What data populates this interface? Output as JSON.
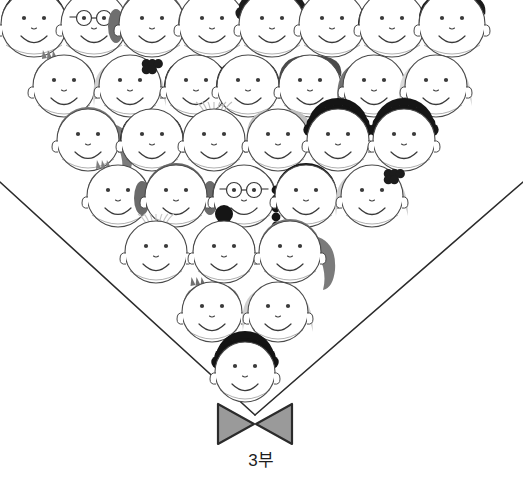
{
  "illustration": {
    "title": "choir-crowd-illustration",
    "background_color": "#ffffff",
    "line_color": "#2b2b2b",
    "face_outline_color": "#4a4a4a",
    "feature_color": "#3a3a3a",
    "collar": {
      "name": "v-neck-collar",
      "left_start": [
        0,
        182
      ],
      "apex": [
        255,
        415
      ],
      "right_start": [
        523,
        182
      ],
      "stroke_width": 1.6,
      "color": "#2b2b2b"
    },
    "bow_tie": {
      "name": "bow-tie",
      "fill_color": "#9a9a9a",
      "stroke_color": "#2b2b2b",
      "center": [
        255,
        424
      ],
      "width": 74,
      "height": 40
    },
    "hair_palette": {
      "black": "#1a1a1a",
      "dark_gray": "#4f4f4f",
      "mid_gray": "#7d7d7d",
      "light_gray": "#aeaeae",
      "pale_gray": "#d2d2d2",
      "blonde": "#c9c9c9"
    },
    "rows": [
      {
        "index": 0,
        "y": 24,
        "faces": [
          {
            "x": 34,
            "r": 33,
            "hair": "spiky-black",
            "hair_color": "#1a1a1a",
            "accessory": "none",
            "clipped_top": true
          },
          {
            "x": 94,
            "r": 33,
            "hair": "short-gray",
            "hair_color": "#8e8e8e",
            "accessory": "glasses",
            "clipped_top": true
          },
          {
            "x": 152,
            "r": 33,
            "hair": "pigtails-gray",
            "hair_color": "#6f6f6f",
            "accessory": "none",
            "clipped_top": true
          },
          {
            "x": 212,
            "r": 33,
            "hair": "bowl-gray",
            "hair_color": "#6b6b6b",
            "accessory": "none",
            "clipped_top": true
          },
          {
            "x": 272,
            "r": 33,
            "hair": "curly-black",
            "hair_color": "#1c1c1c",
            "accessory": "none",
            "clipped_top": true
          },
          {
            "x": 332,
            "r": 33,
            "hair": "wispy-light",
            "hair_color": "#c4c4c4",
            "accessory": "none",
            "clipped_top": true
          },
          {
            "x": 392,
            "r": 33,
            "hair": "bob-black",
            "hair_color": "#141414",
            "accessory": "none",
            "clipped_top": true
          },
          {
            "x": 452,
            "r": 33,
            "hair": "side-part-black",
            "hair_color": "#1a1a1a",
            "accessory": "none",
            "clipped_top": true
          }
        ]
      },
      {
        "index": 1,
        "y": 86,
        "faces": [
          {
            "x": 64,
            "r": 31,
            "hair": "short-gray-tuft",
            "hair_color": "#7a7a7a",
            "accessory": "none"
          },
          {
            "x": 130,
            "r": 31,
            "hair": "blonde-wavy",
            "hair_color": "#cfcfcf",
            "accessory": "hair-bow-black"
          },
          {
            "x": 196,
            "r": 31,
            "hair": "bowl-black",
            "hair_color": "#141414",
            "accessory": "none"
          },
          {
            "x": 248,
            "r": 31,
            "hair": "bowl-black",
            "hair_color": "#141414",
            "accessory": "none"
          },
          {
            "x": 310,
            "r": 31,
            "hair": "short-dark",
            "hair_color": "#4a4a4a",
            "accessory": "none"
          },
          {
            "x": 374,
            "r": 31,
            "hair": "long-gray",
            "hair_color": "#6f6f6f",
            "accessory": "none"
          },
          {
            "x": 436,
            "r": 31,
            "hair": "pale-long",
            "hair_color": "#d8d8d8",
            "accessory": "none"
          }
        ]
      },
      {
        "index": 2,
        "y": 140,
        "faces": [
          {
            "x": 88,
            "r": 31,
            "hair": "ponytail-gray",
            "hair_color": "#7c7c7c",
            "accessory": "none"
          },
          {
            "x": 152,
            "r": 31,
            "hair": "bob-black",
            "hair_color": "#161616",
            "accessory": "none"
          },
          {
            "x": 214,
            "r": 31,
            "hair": "bald-wisp",
            "hair_color": "#bdbdbd",
            "accessory": "none"
          },
          {
            "x": 278,
            "r": 31,
            "hair": "swoop-light",
            "hair_color": "#c0c0c0",
            "accessory": "none"
          },
          {
            "x": 338,
            "r": 31,
            "hair": "curly-black",
            "hair_color": "#141414",
            "accessory": "none"
          },
          {
            "x": 404,
            "r": 31,
            "hair": "curly-black",
            "hair_color": "#161616",
            "accessory": "none"
          }
        ]
      },
      {
        "index": 3,
        "y": 196,
        "faces": [
          {
            "x": 118,
            "r": 31,
            "hair": "short-gray-tuft",
            "hair_color": "#7f7f7f",
            "accessory": "none"
          },
          {
            "x": 176,
            "r": 31,
            "hair": "pigtails-gray",
            "hair_color": "#6a6a6a",
            "accessory": "none"
          },
          {
            "x": 244,
            "r": 31,
            "hair": "bowl-dark",
            "hair_color": "#4c4c4c",
            "accessory": "glasses"
          },
          {
            "x": 306,
            "r": 31,
            "hair": "black-braid",
            "hair_color": "#151515",
            "accessory": "none"
          },
          {
            "x": 372,
            "r": 31,
            "hair": "blonde-wavy",
            "hair_color": "#cccccc",
            "accessory": "hair-bow-black"
          }
        ]
      },
      {
        "index": 4,
        "y": 252,
        "faces": [
          {
            "x": 156,
            "r": 31,
            "hair": "bald-wisp",
            "hair_color": "#c6c6c6",
            "accessory": "none"
          },
          {
            "x": 224,
            "r": 31,
            "hair": "topknot-black",
            "hair_color": "#151515",
            "accessory": "none"
          },
          {
            "x": 290,
            "r": 31,
            "hair": "ponytail-gray",
            "hair_color": "#7b7b7b",
            "accessory": "none"
          }
        ]
      },
      {
        "index": 5,
        "y": 312,
        "faces": [
          {
            "x": 212,
            "r": 30,
            "hair": "short-gray-tuft",
            "hair_color": "#6f6f6f",
            "accessory": "none"
          },
          {
            "x": 278,
            "r": 30,
            "hair": "blonde-straight",
            "hair_color": "#cdcdcd",
            "accessory": "none"
          }
        ]
      },
      {
        "index": 6,
        "y": 372,
        "faces": [
          {
            "x": 245,
            "r": 30,
            "hair": "curly-black",
            "hair_color": "#141414",
            "accessory": "none"
          }
        ]
      }
    ]
  },
  "caption": {
    "text": "3부"
  }
}
